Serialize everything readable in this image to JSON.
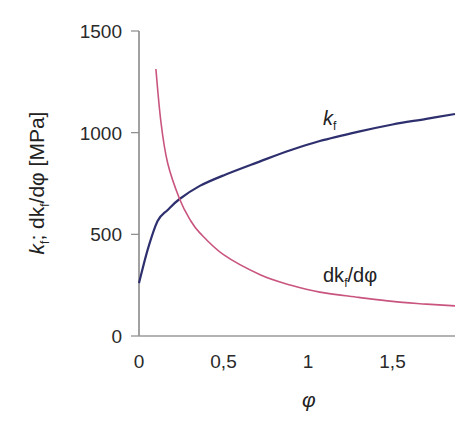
{
  "chart_data": {
    "type": "line",
    "title": "",
    "xlabel": "φ",
    "ylabel": "k_f; dk_f/dφ [MPa]",
    "xlim": [
      0,
      1.87
    ],
    "ylim": [
      0,
      1500
    ],
    "x_ticks": [
      0,
      0.5,
      1,
      1.5
    ],
    "x_tick_labels": [
      "0",
      "0,5",
      "1",
      "1,5"
    ],
    "y_ticks": [
      0,
      500,
      1000,
      1500
    ],
    "y_tick_labels": [
      "0",
      "500",
      "1000",
      "1500"
    ],
    "grid": false,
    "legend": "inline labels",
    "series": [
      {
        "name": "k_f",
        "label_main": "k",
        "label_sub": "f",
        "color": "#2e2f6e",
        "x": [
          0,
          0.05,
          0.11,
          0.17,
          0.24,
          0.36,
          0.5,
          0.72,
          0.9,
          1.07,
          1.3,
          1.5,
          1.7,
          1.87
        ],
        "y": [
          260,
          420,
          565,
          620,
          674,
          738,
          790,
          860,
          915,
          959,
          1005,
          1040,
          1068,
          1092
        ]
      },
      {
        "name": "dk_f/dφ",
        "label_main": "dk",
        "label_sub": "f",
        "label_tail": "/dφ",
        "color": "#c9557f",
        "x": [
          0.1,
          0.13,
          0.17,
          0.24,
          0.3,
          0.36,
          0.5,
          0.72,
          0.9,
          1.07,
          1.3,
          1.5,
          1.7,
          1.87
        ],
        "y": [
          1313,
          1050,
          850,
          674,
          575,
          507,
          400,
          300,
          250,
          216,
          190,
          170,
          157,
          148
        ]
      }
    ]
  },
  "labels": {
    "y_axis_main": "k",
    "y_axis_sub": "f",
    "y_axis_mid": "; dk",
    "y_axis_sub2": "f",
    "y_axis_tail": "/dφ [MPa]",
    "x_axis": "φ"
  }
}
